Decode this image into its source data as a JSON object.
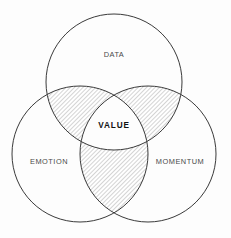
{
  "diagram": {
    "type": "venn",
    "title": "",
    "background_color": "#fdfdfd",
    "stroke_color": "#3a3a3a",
    "hatch_color": "#9a9a9a",
    "hatch_angle_degrees": 45,
    "sets": [
      {
        "id": "data",
        "label": "DATA",
        "position": "top",
        "center_x": 114,
        "center_y": 82,
        "radius": 68,
        "label_x": 114,
        "label_y": 55,
        "label_color": "#4a4a4a"
      },
      {
        "id": "emotion",
        "label": "EMOTION",
        "position": "bottom-left",
        "center_x": 80,
        "center_y": 154,
        "radius": 68,
        "label_x": 49,
        "label_y": 162,
        "label_color": "#4a4a4a"
      },
      {
        "id": "momentum",
        "label": "MOMENTUM",
        "position": "bottom-right",
        "center_x": 148,
        "center_y": 154,
        "radius": 68,
        "label_x": 180,
        "label_y": 162,
        "label_color": "#4a4a4a"
      }
    ],
    "intersections": [
      {
        "id": "data-emotion",
        "sets": [
          "data",
          "emotion"
        ],
        "filled": true,
        "fill_style": "diagonal-hatch"
      },
      {
        "id": "data-momentum",
        "sets": [
          "data",
          "momentum"
        ],
        "filled": true,
        "fill_style": "diagonal-hatch"
      },
      {
        "id": "emotion-momentum",
        "sets": [
          "emotion",
          "momentum"
        ],
        "filled": true,
        "fill_style": "diagonal-hatch"
      }
    ],
    "center_intersection": {
      "id": "value",
      "label": "VALUE",
      "sets": [
        "data",
        "emotion",
        "momentum"
      ],
      "filled": false,
      "label_x": 114,
      "label_y": 126,
      "label_color": "#111111"
    }
  }
}
